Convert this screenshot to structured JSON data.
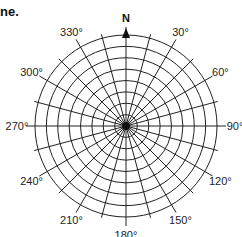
{
  "heading_fragment": "ne.",
  "compass": {
    "north_label": "N",
    "center": [
      126,
      126
    ],
    "radius": 91,
    "rings": 8,
    "radial_step_deg": 15,
    "labels": [
      {
        "deg": 30,
        "text": "30°"
      },
      {
        "deg": 60,
        "text": "60°"
      },
      {
        "deg": 90,
        "text": "90°"
      },
      {
        "deg": 120,
        "text": "120°"
      },
      {
        "deg": 150,
        "text": "150°"
      },
      {
        "deg": 180,
        "text": "180°"
      },
      {
        "deg": 210,
        "text": "210°"
      },
      {
        "deg": 240,
        "text": "240°"
      },
      {
        "deg": 270,
        "text": "270°"
      },
      {
        "deg": 300,
        "text": "300°"
      },
      {
        "deg": 330,
        "text": "330°"
      }
    ]
  }
}
